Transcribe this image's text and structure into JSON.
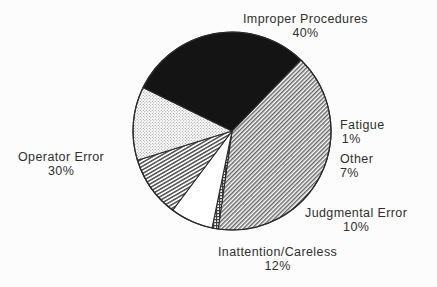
{
  "chart_data": {
    "type": "pie",
    "title": "",
    "subtitle": "",
    "xlabel": "",
    "ylabel": "",
    "legend_position": "none",
    "grid": false,
    "labels_shown": "outside",
    "categories": [
      "Improper Procedures",
      "Fatigue",
      "Other",
      "Judgmental Error",
      "Inattention/Careless",
      "Operator Error"
    ],
    "values": [
      40,
      1,
      7,
      10,
      12,
      30
    ],
    "units": "percent",
    "slices": [
      {
        "name": "Improper Procedures",
        "value": 40,
        "percent_text": "40%",
        "fill_style": "diagonal-hatch-fine",
        "fill_color": "#8c8c8c",
        "start_angle": 314,
        "end_angle": 458
      },
      {
        "name": "Fatigue",
        "value": 1,
        "percent_text": "1%",
        "fill_style": "crosshatch-grid",
        "fill_color": "#555555",
        "start_angle": 98,
        "end_angle": 101.6
      },
      {
        "name": "Other",
        "value": 7,
        "percent_text": "7%",
        "fill_style": "blank-white",
        "fill_color": "#ffffff",
        "start_angle": 101.6,
        "end_angle": 126.8
      },
      {
        "name": "Judgmental Error",
        "value": 10,
        "percent_text": "10%",
        "fill_style": "diagonal-hatch-steep",
        "fill_color": "#6e6e6e",
        "start_angle": 126.8,
        "end_angle": 162.8
      },
      {
        "name": "Inattention/Careless",
        "value": 12,
        "percent_text": "12%",
        "fill_style": "stipple-dots",
        "fill_color": "#d8d8d8",
        "start_angle": 162.8,
        "end_angle": 206
      },
      {
        "name": "Operator Error",
        "value": 30,
        "percent_text": "30%",
        "fill_style": "solid-black",
        "fill_color": "#141414",
        "start_angle": 206,
        "end_angle": 314
      }
    ],
    "geometry": {
      "center_x": 232,
      "center_y": 131,
      "radius": 99
    },
    "colors": {
      "background": "#fcfcfc",
      "outline": "#2b2b2b",
      "text": "#303030"
    }
  },
  "labels": {
    "improper_procedures": {
      "name": "Improper Procedures",
      "pct": "40%"
    },
    "fatigue": {
      "name": "Fatigue",
      "pct": "1%"
    },
    "other": {
      "name": "Other",
      "pct": "7%"
    },
    "judgmental_error": {
      "name": "Judgmental Error",
      "pct": "10%"
    },
    "inattention_careless": {
      "name": "Inattention/Careless",
      "pct": "12%"
    },
    "operator_error": {
      "name": "Operator Error",
      "pct": "30%"
    }
  }
}
